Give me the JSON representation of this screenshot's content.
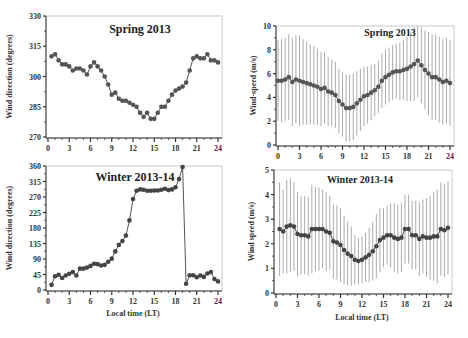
{
  "chart_data": [
    {
      "type": "line",
      "panel": "top-left",
      "title": "Spring 2013",
      "xlabel": "",
      "ylabel": "Wind direction (degrees)",
      "xlim": [
        0,
        24
      ],
      "ylim": [
        270,
        330
      ],
      "xticks": [
        0,
        3,
        6,
        9,
        12,
        15,
        18,
        21,
        24
      ],
      "yticks": [
        270,
        285,
        300,
        315,
        330
      ],
      "grid": false,
      "x": [
        0.5,
        1,
        1.5,
        2,
        2.5,
        3,
        3.5,
        4,
        4.5,
        5,
        5.5,
        6,
        6.5,
        7,
        7.5,
        8,
        8.5,
        9,
        9.5,
        10,
        10.5,
        11,
        11.5,
        12,
        12.5,
        13,
        13.5,
        14,
        14.5,
        15,
        15.5,
        16,
        16.5,
        17,
        17.5,
        18,
        18.5,
        19,
        19.5,
        20,
        20.5,
        21,
        21.5,
        22,
        22.5,
        23,
        23.5,
        24
      ],
      "values": [
        310,
        311,
        308,
        306,
        306,
        305,
        303,
        304,
        304,
        303,
        301,
        305,
        307,
        305,
        303,
        300,
        296,
        291,
        292,
        289,
        288,
        288,
        287,
        286,
        285,
        282,
        280,
        282,
        279,
        279,
        282,
        285,
        285,
        288,
        291,
        293,
        294,
        295,
        297,
        303,
        309,
        310,
        309,
        309,
        311,
        308,
        308,
        307
      ],
      "marker_color": "#555555",
      "line_color": "#555555"
    },
    {
      "type": "line",
      "panel": "top-right",
      "title": "Spring 2013",
      "xlabel": "",
      "ylabel": "Wind-speed (m/s)",
      "xlim": [
        0,
        24
      ],
      "ylim": [
        0,
        10
      ],
      "xticks": [
        0,
        3,
        6,
        9,
        12,
        15,
        18,
        21,
        24
      ],
      "yticks": [
        0,
        2,
        4,
        6,
        8,
        10
      ],
      "grid": false,
      "error_bars": true,
      "x": [
        0,
        0.5,
        1,
        1.5,
        2,
        2.5,
        3,
        3.5,
        4,
        4.5,
        5,
        5.5,
        6,
        6.5,
        7,
        7.5,
        8,
        8.5,
        9,
        9.5,
        10,
        10.5,
        11,
        11.5,
        12,
        12.5,
        13,
        13.5,
        14,
        14.5,
        15,
        15.5,
        16,
        16.5,
        17,
        17.5,
        18,
        18.5,
        19,
        19.5,
        20,
        20.5,
        21,
        21.5,
        22,
        22.5,
        23,
        23.5,
        24
      ],
      "values": [
        5.4,
        5.4,
        5.5,
        5.7,
        5.3,
        5.5,
        5.4,
        5.3,
        5.2,
        5.1,
        5.0,
        4.9,
        4.7,
        4.8,
        4.5,
        4.4,
        4.2,
        3.7,
        3.4,
        3.1,
        3.1,
        3.2,
        3.5,
        3.8,
        4.1,
        4.2,
        4.4,
        4.6,
        4.9,
        5.4,
        5.7,
        5.9,
        6.1,
        6.2,
        6.2,
        6.3,
        6.4,
        6.6,
        6.8,
        7.1,
        6.7,
        6.3,
        6.0,
        5.7,
        5.7,
        5.5,
        5.3,
        5.4,
        5.2
      ],
      "std": [
        3.4,
        3.5,
        3.5,
        3.6,
        3.7,
        3.7,
        3.8,
        3.6,
        3.5,
        3.4,
        3.3,
        3.2,
        3.1,
        3.0,
        2.9,
        2.8,
        2.8,
        2.7,
        2.7,
        2.8,
        2.8,
        2.8,
        2.7,
        2.6,
        2.5,
        2.4,
        2.3,
        2.2,
        2.2,
        2.3,
        2.3,
        2.3,
        2.3,
        2.3,
        2.4,
        2.5,
        2.7,
        2.9,
        3.1,
        3.1,
        3.2,
        3.3,
        3.5,
        3.6,
        3.6,
        3.6,
        3.6,
        3.6,
        3.6
      ],
      "marker_color": "#555555",
      "errorbar_color": "#aaaaaa"
    },
    {
      "type": "line",
      "panel": "bottom-left",
      "title": "Winter  2013-14",
      "xlabel": "Local time (LT)",
      "ylabel": "Wind direction (degrees)",
      "xlim": [
        0,
        24
      ],
      "ylim": [
        0,
        360
      ],
      "xticks": [
        0,
        3,
        6,
        9,
        12,
        15,
        18,
        21,
        24
      ],
      "yticks": [
        0,
        45,
        90,
        135,
        180,
        225,
        270,
        315,
        360
      ],
      "grid": false,
      "x": [
        0.5,
        1,
        1.5,
        2,
        2.5,
        3,
        3.5,
        4,
        4.5,
        5,
        5.5,
        6,
        6.5,
        7,
        7.5,
        8,
        8.5,
        9,
        9.5,
        10,
        10.5,
        11,
        11.5,
        12,
        12.5,
        13,
        13.5,
        14,
        14.5,
        15,
        15.5,
        16,
        16.5,
        17,
        17.5,
        18,
        18.5,
        19,
        19.5,
        20,
        20.5,
        21,
        21.5,
        22,
        22.5,
        23,
        23.5,
        24
      ],
      "values": [
        15,
        40,
        44,
        35,
        42,
        47,
        52,
        42,
        62,
        62,
        65,
        70,
        76,
        75,
        71,
        73,
        82,
        91,
        112,
        131,
        142,
        158,
        202,
        264,
        288,
        292,
        291,
        288,
        288,
        289,
        289,
        291,
        294,
        290,
        292,
        298,
        322,
        357,
        18,
        43,
        43,
        37,
        42,
        38,
        48,
        52,
        32,
        25
      ],
      "marker_color": "#444444",
      "line_color": "#555555"
    },
    {
      "type": "line",
      "panel": "bottom-right",
      "title": "Winter  2013-14",
      "xlabel": "Local time (LT)",
      "ylabel": "Wind speed (m/s)",
      "xlim": [
        0,
        24
      ],
      "ylim": [
        0,
        5
      ],
      "xticks": [
        0,
        3,
        6,
        9,
        12,
        15,
        18,
        21,
        24
      ],
      "yticks": [
        0,
        1,
        2,
        3,
        4,
        5
      ],
      "grid": false,
      "error_bars": true,
      "x": [
        0.5,
        1,
        1.5,
        2,
        2.5,
        3,
        3.5,
        4,
        4.5,
        5,
        5.5,
        6,
        6.5,
        7,
        7.5,
        8,
        8.5,
        9,
        9.5,
        10,
        10.5,
        11,
        11.5,
        12,
        12.5,
        13,
        13.5,
        14,
        14.5,
        15,
        15.5,
        16,
        16.5,
        17,
        17.5,
        18,
        18.5,
        19,
        19.5,
        20,
        20.5,
        21,
        21.5,
        22,
        22.5,
        23,
        23.5,
        24
      ],
      "values": [
        2.6,
        2.5,
        2.7,
        2.75,
        2.7,
        2.4,
        2.35,
        2.35,
        2.3,
        2.6,
        2.6,
        2.6,
        2.6,
        2.5,
        2.45,
        2.1,
        2.05,
        1.95,
        1.75,
        1.6,
        1.5,
        1.35,
        1.3,
        1.35,
        1.45,
        1.55,
        1.7,
        1.9,
        2.15,
        2.25,
        2.35,
        2.35,
        2.25,
        2.2,
        2.25,
        2.6,
        2.6,
        2.35,
        2.35,
        2.2,
        2.3,
        2.25,
        2.25,
        2.3,
        2.3,
        2.6,
        2.55,
        2.65
      ],
      "std": [
        1.9,
        1.7,
        1.9,
        1.9,
        1.8,
        1.7,
        1.6,
        1.6,
        1.6,
        1.8,
        1.7,
        1.7,
        1.6,
        1.6,
        1.5,
        1.5,
        1.5,
        1.5,
        1.4,
        1.3,
        1.2,
        1.0,
        0.95,
        0.95,
        1.0,
        1.1,
        1.2,
        1.3,
        1.3,
        1.2,
        1.2,
        1.3,
        1.4,
        1.4,
        1.4,
        1.4,
        1.4,
        1.4,
        1.4,
        1.5,
        1.5,
        1.6,
        1.7,
        1.8,
        1.9,
        1.9,
        1.9,
        1.9
      ],
      "marker_color": "#444444",
      "errorbar_color": "#aaaaaa"
    }
  ]
}
